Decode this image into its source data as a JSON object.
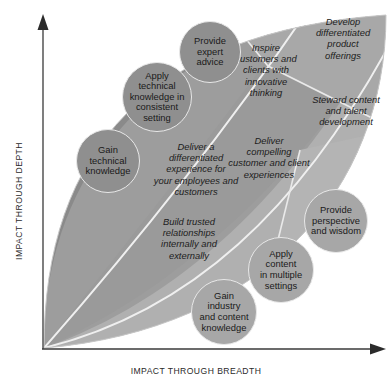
{
  "diagram": {
    "axes": {
      "y_label": "IMPACT THROUGH DEPTH",
      "x_label": "IMPACT THROUGH BREADTH"
    },
    "colors": {
      "background": "#ffffff",
      "band_dark": "#8c8c8c",
      "band_mid": "#9b9b9b",
      "band_light": "#adadad",
      "band_lighter": "#b9b9b9",
      "bubble_dark": "#8f8f8f",
      "bubble_light": "#a7a7a7",
      "outline": "#e8e8e8",
      "axis": "#3a3a3a",
      "text": "#1c1c1c"
    },
    "bubbles": [
      {
        "id": "gain-technical-knowledge",
        "label": "Gain\ntechnical\nknowledge",
        "cx": 108,
        "cy": 161,
        "r": 32,
        "tone": "dark"
      },
      {
        "id": "apply-technical-knowledge",
        "label": "Apply\ntechnical\nknowledge in\nconsistent\nsetting",
        "cx": 157,
        "cy": 97,
        "r": 35,
        "tone": "dark"
      },
      {
        "id": "provide-expert-advice",
        "label": "Provide\nexpert\nadvice",
        "cx": 210,
        "cy": 52,
        "r": 31,
        "tone": "dark"
      },
      {
        "id": "provide-perspective-and-wisdom",
        "label": "Provide\nperspective\nand wisdom",
        "cx": 336,
        "cy": 221,
        "r": 32,
        "tone": "light"
      },
      {
        "id": "apply-content-in-multiple-settings",
        "label": "Apply\ncontent\nin multiple\nsettings",
        "cx": 281,
        "cy": 270,
        "r": 33,
        "tone": "light"
      },
      {
        "id": "gain-industry-and-content-knowledge",
        "label": "Gain\nindustry\nand content\nknowledge",
        "cx": 224,
        "cy": 312,
        "r": 33,
        "tone": "light"
      }
    ],
    "phrases": [
      {
        "id": "deliver-differentiated-experience",
        "text": "Deliver a\ndifferentiated\nexperience for\nyour employees and\ncustomers",
        "x": 131,
        "y": 141,
        "w": 130,
        "align": "center"
      },
      {
        "id": "build-trusted-relationships",
        "text": "Build trusted\nrelationships\ninternally and\nexternally",
        "x": 136,
        "y": 216,
        "w": 106,
        "align": "center"
      },
      {
        "id": "inspire-customers-and-clients",
        "text": "Inspire\ncustomers and\nclients with\ninnovative\nthinking",
        "x": 224,
        "y": 42,
        "w": 84,
        "align": "center"
      },
      {
        "id": "develop-differentiated-product-offerings",
        "text": "Develop\ndifferentiated\nproduct\nofferings",
        "x": 302,
        "y": 16,
        "w": 82,
        "align": "center"
      },
      {
        "id": "steward-content-and-talent-development",
        "text": "Steward content\nand talent\ndevelopment",
        "x": 300,
        "y": 94,
        "w": 92,
        "align": "center"
      },
      {
        "id": "deliver-compelling-customer-experiences",
        "text": "Deliver\ncompelling\ncustomer and client\nexperiences",
        "x": 212,
        "y": 135,
        "w": 114,
        "align": "center"
      }
    ]
  }
}
